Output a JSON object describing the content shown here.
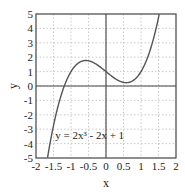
{
  "chart_data": {
    "type": "line",
    "title": "",
    "xlabel": "x",
    "ylabel": "y",
    "xlim": [
      -2,
      2
    ],
    "ylim": [
      -5,
      5
    ],
    "grid": true,
    "legend": null,
    "xticks": [
      -2,
      -1.5,
      -1,
      -0.5,
      0,
      0.5,
      1,
      1.5,
      2
    ],
    "xtick_labels": [
      "-2",
      "-1.5",
      "-1",
      "-0.5",
      "0",
      "0.5",
      "1",
      "1.5",
      "2"
    ],
    "yticks": [
      -5,
      -4,
      -3,
      -2,
      -1,
      0,
      1,
      2,
      3,
      4,
      5
    ],
    "ytick_labels": [
      "-5",
      "-4",
      "-3",
      "-2",
      "-1",
      "0",
      "1",
      "2",
      "3",
      "4",
      "5"
    ],
    "annotation": {
      "text": "y = 2x³ - 2x + 1",
      "x": -1.45,
      "y": -3.7
    },
    "series": [
      {
        "name": "y = 2x^3 - 2x + 1",
        "function": "2x^3 - 2x + 1",
        "x": [
          -1.65,
          -1.5,
          -1.25,
          -1.0,
          -0.75,
          -0.577,
          -0.5,
          -0.25,
          0.0,
          0.25,
          0.5,
          0.577,
          0.75,
          1.0,
          1.25,
          1.5,
          1.55
        ],
        "y": [
          -4.68,
          -2.75,
          -0.41,
          1.0,
          1.66,
          1.77,
          1.75,
          1.47,
          1.0,
          0.53,
          0.25,
          0.23,
          0.34,
          1.0,
          2.41,
          4.75,
          5.35
        ]
      }
    ],
    "colors": {
      "line": "#555555",
      "frame": "#444444",
      "grid": "#bbbbbb",
      "zero_axes": "#444444"
    }
  }
}
